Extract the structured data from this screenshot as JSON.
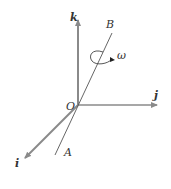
{
  "diagram": {
    "axes": {
      "k": {
        "label": "k"
      },
      "j": {
        "label": "j"
      },
      "i": {
        "label": "i"
      }
    },
    "origin": {
      "label": "O"
    },
    "line_points": {
      "top": "B",
      "bottom": "A"
    },
    "rotation": {
      "label": "ω"
    },
    "colors": {
      "axis": "#8a8a8a",
      "line": "#555555",
      "text": "#333333"
    }
  }
}
